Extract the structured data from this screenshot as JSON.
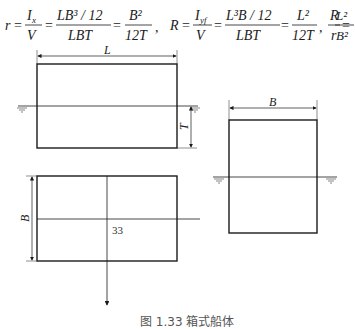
{
  "formulas": {
    "r": {
      "lhs": "r",
      "num1": "I",
      "num1_sub": "x",
      "den1": "V",
      "num2": "LB³ / 12",
      "den2": "LBT",
      "num3": "B²",
      "den3": "12T"
    },
    "R": {
      "lhs": "R",
      "num1": "I",
      "num1_sub": "yf",
      "den1": "V",
      "num2": "L³B / 12",
      "den2": "LBT",
      "num3": "L²",
      "den3": "12T"
    },
    "ratio": {
      "num_l": "R",
      "den_l": "r",
      "num_r": "L²",
      "den_r": "B²"
    },
    "separator": ","
  },
  "views": {
    "side": {
      "length_label": "L",
      "draft_label": "T"
    },
    "plan": {
      "breadth_label": "B",
      "center_label": "33"
    },
    "section": {
      "breadth_label": "B"
    }
  },
  "caption": "图 1.33  箱式船体",
  "colors": {
    "line": "#1a1a1a",
    "thin": "#444444"
  }
}
